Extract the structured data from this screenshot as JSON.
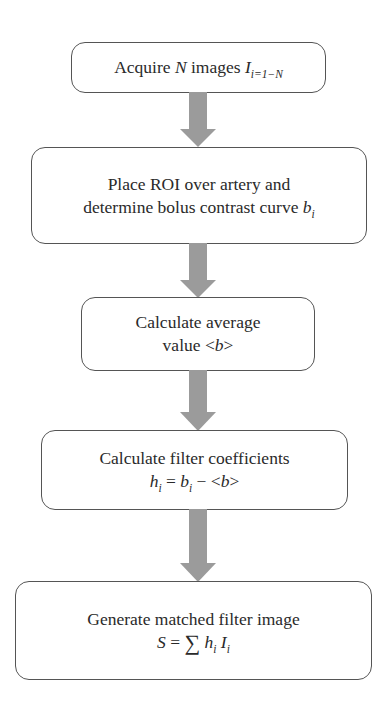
{
  "diagram": {
    "type": "flowchart",
    "direction": "top-to-bottom",
    "colors": {
      "box_border": "#555555",
      "box_fill": "#ffffff",
      "arrow_fill": "#9b9b9b",
      "text": "#2a2a2a"
    },
    "steps": [
      {
        "id": "acquire",
        "text_parts": {
          "a": "Acquire ",
          "n": "N",
          "b": " images ",
          "I": "I",
          "sub": "i=1−N"
        },
        "plain": "Acquire N images I_{i=1−N}"
      },
      {
        "id": "roi",
        "line1": "Place ROI over artery and",
        "line2_a": "determine bolus contrast curve ",
        "line2_b": "b",
        "line2_sub": "i",
        "plain": "Place ROI over artery and determine bolus contrast curve b_i"
      },
      {
        "id": "average",
        "line1": "Calculate average",
        "line2_a": "value <",
        "line2_b": "b",
        "line2_c": ">",
        "plain": "Calculate average value <b>"
      },
      {
        "id": "coefficients",
        "line1": "Calculate filter coefficients",
        "eq_h": "h",
        "eq_h_sub": "i",
        "eq_eq": " = ",
        "eq_b": "b",
        "eq_b_sub": "i",
        "eq_minus": " − <",
        "eq_b2": "b",
        "eq_close": ">",
        "plain": "Calculate filter coefficients h_i = b_i − <b>"
      },
      {
        "id": "matched",
        "line1": "Generate matched filter image",
        "eq_S": "S",
        "eq_eq": " = ",
        "eq_sigma": "∑",
        "eq_h": "h",
        "eq_h_sub": "i",
        "eq_I": "I",
        "eq_I_sub": "i",
        "plain": "Generate matched filter image S = ∑ h_i I_i"
      }
    ],
    "connectors": [
      {
        "from": "acquire",
        "to": "roi",
        "icon": "down-arrow-icon"
      },
      {
        "from": "roi",
        "to": "average",
        "icon": "down-arrow-icon"
      },
      {
        "from": "average",
        "to": "coefficients",
        "icon": "down-arrow-icon"
      },
      {
        "from": "coefficients",
        "to": "matched",
        "icon": "down-arrow-icon"
      }
    ]
  }
}
